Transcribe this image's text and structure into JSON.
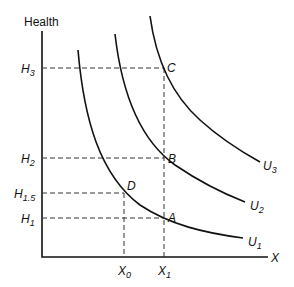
{
  "diagram": {
    "y_axis_label": "Health",
    "x_axis_label": "X",
    "y_ticks": [
      {
        "base": "H",
        "sub": "3"
      },
      {
        "base": "H",
        "sub": "2"
      },
      {
        "base": "H",
        "sub": "1.5"
      },
      {
        "base": "H",
        "sub": "1"
      }
    ],
    "x_ticks": [
      {
        "base": "X",
        "sub": "0"
      },
      {
        "base": "X",
        "sub": "1"
      }
    ],
    "points": [
      "A",
      "B",
      "C",
      "D"
    ],
    "curves": [
      {
        "base": "U",
        "sub": "1"
      },
      {
        "base": "U",
        "sub": "2"
      },
      {
        "base": "U",
        "sub": "3"
      }
    ]
  }
}
